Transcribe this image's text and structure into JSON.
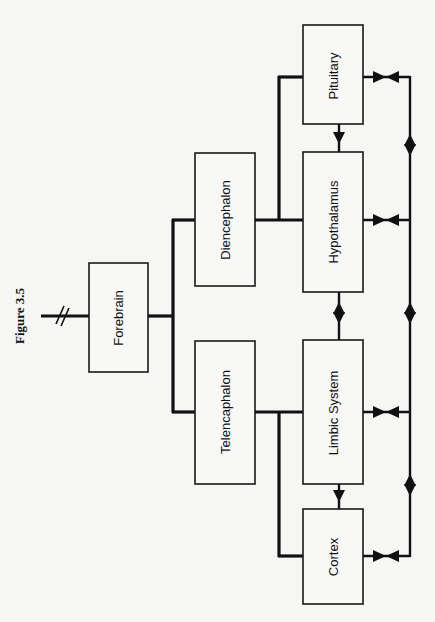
{
  "figure": {
    "title": "Figure 3.5",
    "orientation": "rotated-90-ccw"
  },
  "nodes": {
    "forebrain": "Forebrain",
    "diencephalon": "Diencephalon",
    "telencaphalon": "Telencaphalon",
    "pituitary": "Pituitary",
    "hypothalamus": "Hypothalamus",
    "limbic_system": "Limbic System",
    "cortex": "Cortex"
  },
  "edges": [
    {
      "from": "Forebrain",
      "to": "Diencephalon",
      "type": "line"
    },
    {
      "from": "Forebrain",
      "to": "Telencaphalon",
      "type": "line"
    },
    {
      "from": "Diencephalon",
      "to": "Pituitary",
      "type": "line"
    },
    {
      "from": "Diencephalon",
      "to": "Hypothalamus",
      "type": "line"
    },
    {
      "from": "Telencaphalon",
      "to": "Limbic System",
      "type": "line"
    },
    {
      "from": "Telencaphalon",
      "to": "Cortex",
      "type": "line"
    },
    {
      "from": "Pituitary",
      "to": "Hypothalamus",
      "type": "arrow"
    },
    {
      "from": "Hypothalamus",
      "to": "Limbic System",
      "type": "bidirectional"
    },
    {
      "from": "Limbic System",
      "to": "Cortex",
      "type": "arrow"
    },
    {
      "from": "Pituitary",
      "to": "feedback-bus",
      "type": "bidirectional"
    },
    {
      "from": "Hypothalamus",
      "to": "feedback-bus",
      "type": "bidirectional"
    },
    {
      "from": "Limbic System",
      "to": "feedback-bus",
      "type": "bidirectional"
    },
    {
      "from": "Cortex",
      "to": "feedback-bus",
      "type": "bidirectional"
    }
  ],
  "colors": {
    "background": "#f6f6f4",
    "ink": "#111111"
  }
}
